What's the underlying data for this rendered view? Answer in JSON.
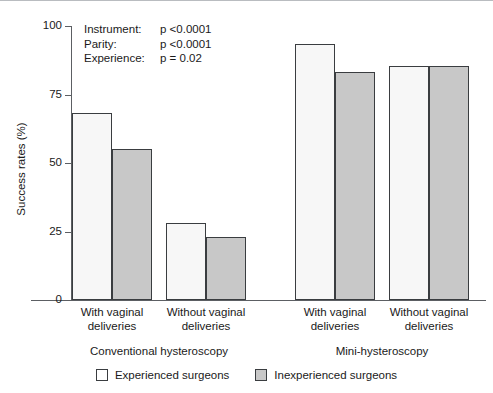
{
  "chart_data": {
    "type": "bar",
    "title": "",
    "xlabel": "",
    "ylabel": "Success rates (%)",
    "ylim": [
      0,
      100
    ],
    "yticks": [
      0,
      25,
      50,
      75,
      100
    ],
    "ytick_labels": [
      "0",
      "25",
      "50",
      "75",
      "100"
    ],
    "grid": false,
    "legend_position": "bottom",
    "categories": [
      "With vaginal deliveries",
      "Without vaginal deliveries",
      "With vaginal deliveries",
      "Without vaginal deliveries"
    ],
    "groups": [
      {
        "label": "Conventional hysteroscopy",
        "categories": [
          "With vaginal deliveries",
          "Without vaginal deliveries"
        ]
      },
      {
        "label": "Mini-hysteroscopy",
        "categories": [
          "With vaginal deliveries",
          "Without vaginal deliveries"
        ]
      }
    ],
    "series": [
      {
        "name": "Experienced surgeons",
        "color": "#f7f7f7",
        "values": [
          68,
          28,
          93,
          85
        ]
      },
      {
        "name": "Inexperienced surgeons",
        "color": "#c8c8c8",
        "values": [
          55,
          23,
          83,
          85
        ]
      }
    ],
    "annotations": [
      {
        "key": "Instrument:",
        "value": "p <0.0001"
      },
      {
        "key": "Parity:",
        "value": "p <0.0001"
      },
      {
        "key": "Experience:",
        "value": "p = 0.02"
      }
    ],
    "bars": [
      {
        "name": "conventional-with-experienced",
        "value": 68,
        "style": "light",
        "left": 72,
        "width": 40
      },
      {
        "name": "conventional-with-inexperienced",
        "value": 55,
        "style": "dark",
        "left": 112,
        "width": 40
      },
      {
        "name": "conventional-without-experienced",
        "value": 28,
        "style": "light",
        "left": 166,
        "width": 40
      },
      {
        "name": "conventional-without-inexperienced",
        "value": 23,
        "style": "dark",
        "left": 206,
        "width": 40
      },
      {
        "name": "mini-with-experienced",
        "value": 93,
        "style": "light",
        "left": 295,
        "width": 40
      },
      {
        "name": "mini-with-inexperienced",
        "value": 83,
        "style": "dark",
        "left": 335,
        "width": 40
      },
      {
        "name": "mini-without-experienced",
        "value": 85,
        "style": "light",
        "left": 389,
        "width": 40
      },
      {
        "name": "mini-without-inexperienced",
        "value": 85,
        "style": "dark",
        "left": 429,
        "width": 40
      }
    ]
  },
  "axis": {
    "y_title": "Success rates (%)",
    "ticks": [
      {
        "label": "100",
        "value": 100
      },
      {
        "label": "75",
        "value": 75
      },
      {
        "label": "50",
        "value": 50
      },
      {
        "label": "25",
        "value": 25
      },
      {
        "label": "0",
        "value": 0
      }
    ]
  },
  "category_labels": [
    {
      "line1": "With vaginal",
      "line2": "deliveries",
      "center": 112
    },
    {
      "line1": "Without vaginal",
      "line2": "deliveries",
      "center": 206
    },
    {
      "line1": "With vaginal",
      "line2": "deliveries",
      "center": 335
    },
    {
      "line1": "Without vaginal",
      "line2": "deliveries",
      "center": 429
    }
  ],
  "group_labels": [
    {
      "text": "Conventional hysteroscopy",
      "center": 159
    },
    {
      "text": "Mini-hysteroscopy",
      "center": 382
    }
  ],
  "legend": {
    "items": [
      {
        "label": "Experienced surgeons",
        "style": "light"
      },
      {
        "label": "Inexperienced surgeons",
        "style": "dark"
      }
    ]
  }
}
